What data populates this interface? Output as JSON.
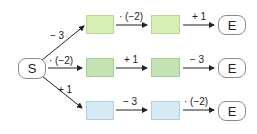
{
  "start": {
    "label": "S"
  },
  "end": {
    "label": "E"
  },
  "branches": [
    {
      "entry_op": "− 3",
      "ops": [
        "· (−2)",
        "+ 1"
      ],
      "color": "#d8efb4"
    },
    {
      "entry_op": "· (−2)",
      "ops": [
        "+ 1",
        "− 3"
      ],
      "color": "#c4e4b4"
    },
    {
      "entry_op": "+ 1",
      "ops": [
        "− 3",
        "· (−2)"
      ],
      "color": "#d6eaf6"
    }
  ]
}
